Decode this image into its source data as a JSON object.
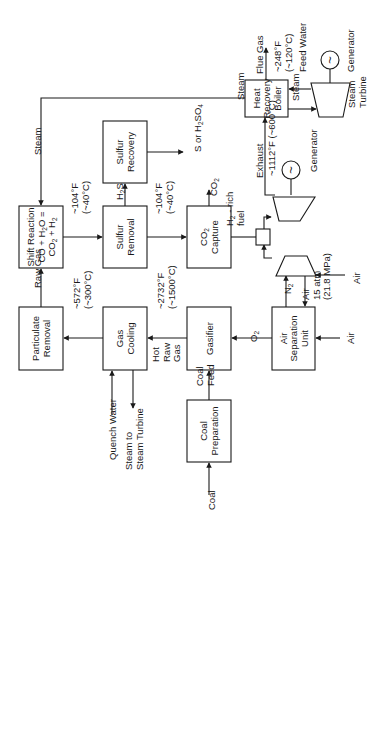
{
  "orientation": "rotated -90deg (text reads bottom-to-top)",
  "colors": {
    "ink": "#1a1a1a",
    "background": "#ffffff"
  },
  "boxes": [
    {
      "id": "particulate-removal",
      "lines": [
        "Particulate",
        "Removal"
      ],
      "x": 19,
      "y": 307,
      "w": 44,
      "h": 63
    },
    {
      "id": "gas-cooling",
      "lines": [
        "Gas",
        "Cooling"
      ],
      "x": 103,
      "y": 307,
      "w": 44,
      "h": 63
    },
    {
      "id": "gasifier",
      "lines": [
        "Gasifier"
      ],
      "x": 187,
      "y": 307,
      "w": 44,
      "h": 63
    },
    {
      "id": "air-separation-unit",
      "lines": [
        "Air",
        "Separation",
        "Unit"
      ],
      "x": 272,
      "y": 307,
      "w": 43,
      "h": 63
    },
    {
      "id": "coal-preparation",
      "lines": [
        "Coal",
        "Preparation"
      ],
      "x": 187,
      "y": 400,
      "w": 44,
      "h": 62
    },
    {
      "id": "shift-reaction",
      "lines": [
        "Shift Reaction",
        "CO + H{2}O =",
        "CO{2} + H{2}"
      ],
      "x": 19,
      "y": 206,
      "w": 44,
      "h": 62
    },
    {
      "id": "sulfur-removal",
      "lines": [
        "Sulfur",
        "Removal"
      ],
      "x": 103,
      "y": 206,
      "w": 44,
      "h": 62
    },
    {
      "id": "co2-capture",
      "lines": [
        "CO{2}",
        "Capture"
      ],
      "x": 187,
      "y": 206,
      "w": 44,
      "h": 62
    },
    {
      "id": "sulfur-recovery",
      "lines": [
        "Sulfur",
        "Recovery"
      ],
      "x": 103,
      "y": 121,
      "w": 44,
      "h": 62
    },
    {
      "id": "heat-recovery-boiler",
      "lines": [
        "Heat",
        "Recovery",
        "Boiler"
      ],
      "x": 245,
      "y": 80,
      "w": 43,
      "h": 37
    }
  ],
  "labels": [
    {
      "id": "coal-input",
      "lines": [
        "Coal"
      ],
      "x": 211,
      "y": 510
    },
    {
      "id": "coal-feed",
      "lines": [
        "Coal",
        "Feed"
      ],
      "x": 205,
      "y": 386
    },
    {
      "id": "hot-raw-gas",
      "lines": [
        "Hot",
        "Raw",
        "Gas"
      ],
      "x": 166,
      "y": 362
    },
    {
      "id": "temp-gasifier-out",
      "lines": [
        "~2732°F",
        "(~1500°C)"
      ],
      "x": 166,
      "y": 309
    },
    {
      "id": "temp-cooling-out",
      "lines": [
        "~572°F",
        "(~300°C)"
      ],
      "x": 82,
      "y": 309
    },
    {
      "id": "quench-water",
      "lines": [
        "Quench Water"
      ],
      "x": 112,
      "y": 460
    },
    {
      "id": "steam-to-turbine",
      "lines": [
        "Steam to",
        "Steam Turbine"
      ],
      "x": 134,
      "y": 470
    },
    {
      "id": "raw-gas",
      "lines": [
        "Raw Gas"
      ],
      "x": 37,
      "y": 288
    },
    {
      "id": "steam-to-shift",
      "lines": [
        "Steam"
      ],
      "x": 37,
      "y": 155
    },
    {
      "id": "temp-shift-out",
      "lines": [
        "~104°F",
        "(~40°C)"
      ],
      "x": 80,
      "y": 214
    },
    {
      "id": "temp-sulfur-out",
      "lines": [
        "~104°F",
        "(~40°C)"
      ],
      "x": 164,
      "y": 214
    },
    {
      "id": "h2s",
      "lines": [
        "H{2}S"
      ],
      "x": 119,
      "y": 200
    },
    {
      "id": "s-or-h2so4",
      "lines": [
        "S or H{2}SO{4}"
      ],
      "x": 197,
      "y": 152
    },
    {
      "id": "co2-out",
      "lines": [
        "CO{2}"
      ],
      "x": 213,
      "y": 196
    },
    {
      "id": "h2-rich-fuel",
      "lines": [
        "H{2} - rich",
        "fuel"
      ],
      "x": 235,
      "y": 226
    },
    {
      "id": "o2",
      "lines": [
        "O{2}"
      ],
      "x": 253,
      "y": 342
    },
    {
      "id": "air-to-asu",
      "lines": [
        "Air"
      ],
      "x": 350,
      "y": 344
    },
    {
      "id": "n2",
      "lines": [
        "N{2}"
      ],
      "x": 287,
      "y": 294
    },
    {
      "id": "air-compressed",
      "lines": [
        "Air",
        "15 atm",
        "(21.8 MPa)"
      ],
      "x": 316,
      "y": 300
    },
    {
      "id": "air-to-compressor",
      "lines": [
        "Air"
      ],
      "x": 356,
      "y": 284
    },
    {
      "id": "exhaust",
      "lines": [
        "Exhaust"
      ],
      "x": 259,
      "y": 178
    },
    {
      "id": "temp-exhaust",
      "lines": [
        "~1112°F (~600°C)"
      ],
      "x": 271,
      "y": 176
    },
    {
      "id": "gas-turbine-generator",
      "lines": [
        "Generator"
      ],
      "x": 313,
      "y": 172
    },
    {
      "id": "steam-from-hrsg",
      "lines": [
        "Steam"
      ],
      "x": 240,
      "y": 100
    },
    {
      "id": "flue-gas",
      "lines": [
        "Flue Gas"
      ],
      "x": 259,
      "y": 74
    },
    {
      "id": "temp-flue-gas",
      "lines": [
        "~248°F",
        "(~120°C)"
      ],
      "x": 283,
      "y": 72
    },
    {
      "id": "feed-water",
      "lines": [
        "Feed Water"
      ],
      "x": 302,
      "y": 72
    },
    {
      "id": "steam-to-st",
      "lines": [
        "Steam"
      ],
      "x": 295,
      "y": 101
    },
    {
      "id": "steam-turbine-label",
      "lines": [
        "Steam",
        "Turbine"
      ],
      "x": 357,
      "y": 108
    },
    {
      "id": "steam-turbine-generator",
      "lines": [
        "Generator"
      ],
      "x": 350,
      "y": 72
    }
  ]
}
